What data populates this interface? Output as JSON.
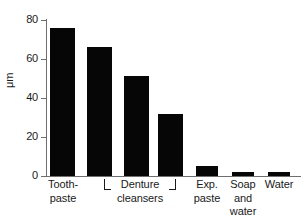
{
  "chart_data": {
    "type": "bar",
    "title": "",
    "subtitle": "",
    "xlabel": "",
    "ylabel": "μm",
    "ylim": [
      0,
      80
    ],
    "yticks": [
      0,
      20,
      40,
      60,
      80
    ],
    "ytick_labels": [
      "0",
      "20",
      "40",
      "60",
      "80"
    ],
    "grid": false,
    "legend": "none",
    "bar_color": "#060606",
    "axis_color": "#6f6f6f",
    "text_color": "#1a1a1a",
    "categories": [
      "Tooth-\npaste",
      "Denture\ncleansers",
      "",
      "",
      "Exp.\npaste",
      "Soap\nand\nwater",
      "Water"
    ],
    "values": [
      76,
      66,
      51.5,
      32,
      5.3,
      2.1,
      2.3
    ],
    "bars": [
      {
        "label": "Tooth-paste",
        "value": 76,
        "x": 50,
        "width": 25
      },
      {
        "label": "Denture cleanser 1",
        "value": 66,
        "x": 87,
        "width": 25
      },
      {
        "label": "Denture cleanser 2",
        "value": 51.5,
        "x": 124,
        "width": 25
      },
      {
        "label": "Denture cleanser 3",
        "value": 32,
        "x": 158,
        "width": 25
      },
      {
        "label": "Exp. paste",
        "value": 5.3,
        "x": 196,
        "width": 22
      },
      {
        "label": "Soap and water",
        "value": 2.1,
        "x": 232,
        "width": 22
      },
      {
        "label": "Water",
        "value": 2.3,
        "x": 268,
        "width": 22
      }
    ],
    "annotations": [
      {
        "type": "group-bracket",
        "label": "Denture cleansers",
        "spans": [
          "Denture cleanser 1",
          "Denture cleanser 2",
          "Denture cleanser 3"
        ]
      }
    ]
  },
  "axis": {
    "y_title": "μm",
    "tick_80": "80",
    "tick_60": "60",
    "tick_40": "40",
    "tick_20": "20",
    "tick_0": "0"
  },
  "categories": {
    "toothpaste": "Tooth-\npaste",
    "denture_cleansers": "Denture\ncleansers",
    "exp_paste": "Exp.\npaste",
    "soap_and_water": "Soap\nand\nwater",
    "water": "Water"
  }
}
